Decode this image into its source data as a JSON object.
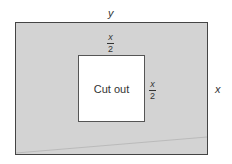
{
  "diagram": {
    "outer_width_label": "y",
    "outer_height_label": "x",
    "cutout_label": "Cut out",
    "cutout_top_fraction": {
      "numerator": "x",
      "denominator": "2"
    },
    "cutout_side_fraction": {
      "numerator": "x",
      "denominator": "2"
    },
    "colors": {
      "sheet": "#d3d3d3",
      "cutout": "#ffffff",
      "border": "#444444"
    }
  }
}
